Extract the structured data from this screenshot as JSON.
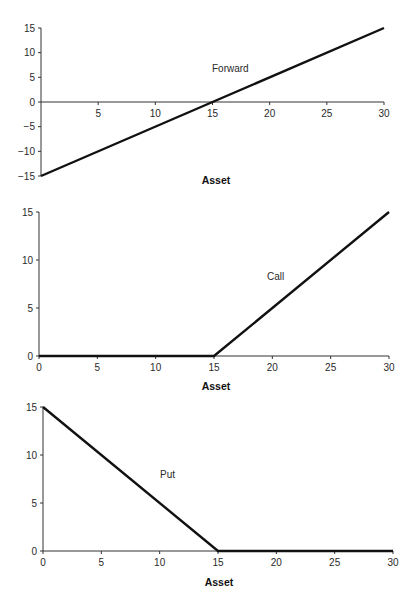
{
  "colors": {
    "background": "#ffffff",
    "axis": "#333333",
    "line": "#111111",
    "text": "#2a2a2a"
  },
  "chart_data": [
    {
      "type": "line",
      "title": "",
      "series_label": "Forward",
      "xlabel": "Asset",
      "ylabel": "",
      "xlim": [
        0,
        30
      ],
      "ylim": [
        -15,
        15
      ],
      "x_ticks": [
        5,
        10,
        15,
        20,
        25,
        30
      ],
      "x_tick_labels": [
        "5",
        "10",
        "15",
        "20",
        "25",
        "30"
      ],
      "y_ticks": [
        15,
        10,
        5,
        0,
        -5,
        -10,
        -15
      ],
      "y_tick_labels": [
        "15",
        "10",
        "5",
        "0",
        "−5",
        "−10",
        "−15"
      ],
      "grid": false,
      "legend": "none",
      "x_axis_at_y": 0,
      "series": [
        {
          "name": "Forward",
          "x": [
            0,
            15,
            30
          ],
          "values": [
            -15,
            0,
            15
          ]
        }
      ],
      "layout": {
        "px_x0": 41,
        "px_x1": 384,
        "px_ytop": 28,
        "px_ybot": 176,
        "label_pos": [
          212,
          72
        ],
        "xlabel_pos": [
          216,
          184
        ]
      }
    },
    {
      "type": "line",
      "title": "",
      "series_label": "Call",
      "xlabel": "Asset",
      "ylabel": "",
      "xlim": [
        0,
        30
      ],
      "ylim": [
        0,
        15
      ],
      "x_ticks": [
        0,
        5,
        10,
        15,
        20,
        25,
        30
      ],
      "x_tick_labels": [
        "0",
        "5",
        "10",
        "15",
        "20",
        "25",
        "30"
      ],
      "y_ticks": [
        15,
        10,
        5,
        0
      ],
      "y_tick_labels": [
        "15",
        "10",
        "5",
        "0"
      ],
      "grid": false,
      "legend": "none",
      "x_axis_at_y": 0,
      "series": [
        {
          "name": "Call",
          "x": [
            0,
            15,
            30
          ],
          "values": [
            0,
            0,
            15
          ]
        }
      ],
      "layout": {
        "px_x0": 39,
        "px_x1": 389,
        "px_ytop": 212,
        "px_ybot": 356,
        "label_pos": [
          267,
          280
        ],
        "xlabel_pos": [
          216,
          390
        ]
      }
    },
    {
      "type": "line",
      "title": "",
      "series_label": "Put",
      "xlabel": "Asset",
      "ylabel": "",
      "xlim": [
        0,
        30
      ],
      "ylim": [
        0,
        15
      ],
      "x_ticks": [
        0,
        5,
        10,
        15,
        20,
        25,
        30
      ],
      "x_tick_labels": [
        "0",
        "5",
        "10",
        "15",
        "20",
        "25",
        "30"
      ],
      "y_ticks": [
        15,
        10,
        5,
        0
      ],
      "y_tick_labels": [
        "15",
        "10",
        "5",
        "0"
      ],
      "grid": false,
      "legend": "none",
      "x_axis_at_y": 0,
      "series": [
        {
          "name": "Put",
          "x": [
            0,
            15,
            30
          ],
          "values": [
            15,
            0,
            0
          ]
        }
      ],
      "layout": {
        "px_x0": 43,
        "px_x1": 393,
        "px_ytop": 407,
        "px_ybot": 551,
        "label_pos": [
          160,
          478
        ],
        "xlabel_pos": [
          219,
          586
        ]
      }
    }
  ]
}
